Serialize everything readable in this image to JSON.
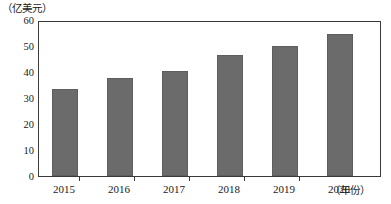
{
  "chart_data": {
    "type": "bar",
    "title": "",
    "subtitle": "",
    "categories": [
      "2015",
      "2016",
      "2017",
      "2018",
      "2019",
      "2020"
    ],
    "values": [
      34,
      38,
      41,
      47,
      50.5,
      55.5
    ],
    "series": [
      {
        "name": "",
        "values": [
          34,
          38,
          41,
          47,
          50.5,
          55.5
        ]
      }
    ],
    "xlabel": "（年份）",
    "ylabel": "（亿美元）",
    "ylim": [
      0,
      60
    ],
    "yticks": [
      "0",
      "10",
      "20",
      "30",
      "40",
      "50",
      "60"
    ],
    "ytick_values": [
      0,
      10,
      20,
      30,
      40,
      50,
      60
    ],
    "grid": false,
    "legend": false,
    "legend_position": "none",
    "bar_color": "#6b6b6b",
    "axis_color": "#3a3a3a",
    "background_color": "#ffffff",
    "annotations": []
  }
}
